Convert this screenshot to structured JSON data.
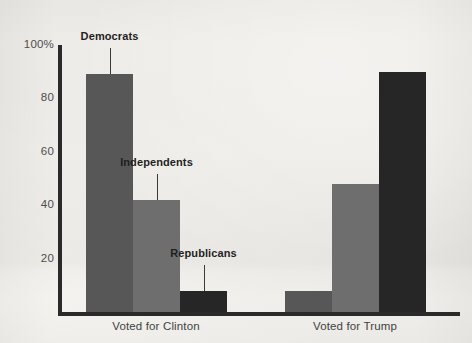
{
  "chart_data": {
    "type": "bar",
    "title": "",
    "subtitle": "",
    "xlabel": "",
    "ylabel": "",
    "ylim": [
      0,
      100
    ],
    "yticks": [
      {
        "value": 100,
        "label": "100%"
      },
      {
        "value": 80,
        "label": "80"
      },
      {
        "value": 60,
        "label": "60"
      },
      {
        "value": 40,
        "label": "40"
      },
      {
        "value": 20,
        "label": "20"
      }
    ],
    "grid": false,
    "legend_position": "none",
    "categories": [
      "Voted for Clinton",
      "Voted for Trump"
    ],
    "series": [
      {
        "name": "Democrats",
        "color": "#575757",
        "values": [
          89,
          8
        ]
      },
      {
        "name": "Independents",
        "color": "#6e6e6e",
        "values": [
          42,
          48
        ]
      },
      {
        "name": "Republicans",
        "color": "#262626",
        "values": [
          8,
          90
        ]
      }
    ],
    "annotations": [
      {
        "label": "Democrats",
        "series": "Democrats",
        "category": "Voted for Clinton"
      },
      {
        "label": "Independents",
        "series": "Independents",
        "category": "Voted for Clinton"
      },
      {
        "label": "Republicans",
        "series": "Republicans",
        "category": "Voted for Clinton"
      }
    ]
  },
  "colors": {
    "background": "#eceae6",
    "axis": "#2a2a2a",
    "tick_text": "#4d4d4d",
    "category_text": "#3f3f3f",
    "annotation_text": "#1f1f1f",
    "series_democrats": "#575757",
    "series_independents": "#6e6e6e",
    "series_republicans": "#262626"
  },
  "geometry": {
    "plot_left": 58,
    "plot_right": 460,
    "baseline_y": 312,
    "top_y": 45,
    "y_value_top": 100,
    "group_bar_width": 47,
    "groups": [
      {
        "name": "Voted for Clinton",
        "start_x": 86,
        "center_x": 156
      },
      {
        "name": "Voted for Trump",
        "start_x": 285,
        "center_x": 355
      }
    ]
  }
}
